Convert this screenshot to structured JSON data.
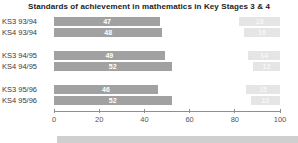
{
  "title": "Standards of achievement in mathematics in Key Stages 3 & 4",
  "colors": {
    "main_bar": "#a1a1a1",
    "secondary_bar": "#e5e5e5",
    "bar_value_text": "#ffffff",
    "secondary_value_text": "#f7f7f7",
    "axis": "#8f8f8f",
    "tick_text": "#555555",
    "label_text": "#3a3a3a",
    "footer_band": "#cfcfcf"
  },
  "chart_data": {
    "type": "bar",
    "orientation": "horizontal",
    "title": "Standards of achievement in mathematics in Key Stages 3 & 4",
    "categories": [
      "KS3 93/94",
      "KS4 93/94",
      "KS3 94/95",
      "KS4 94/95",
      "KS3 95/96",
      "KS4 95/96"
    ],
    "series": [
      {
        "name": "main-left-anchored",
        "values": [
          47,
          48,
          49,
          52,
          46,
          52
        ]
      },
      {
        "name": "secondary-right-anchored",
        "values": [
          18,
          16,
          14,
          12,
          15,
          13
        ]
      }
    ],
    "xlabel": "",
    "ylabel": "",
    "xlim": [
      0,
      100
    ],
    "ticks": [
      0,
      20,
      40,
      60,
      80,
      100
    ],
    "grid": false,
    "legend": "none"
  }
}
